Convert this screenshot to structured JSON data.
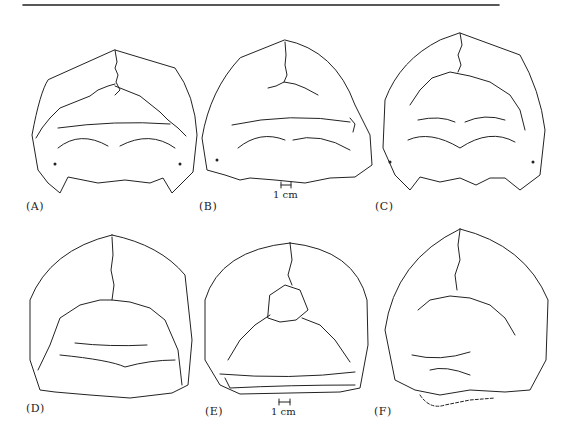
{
  "figure": {
    "panels": [
      {
        "id": "A",
        "label": "(A)"
      },
      {
        "id": "B",
        "label": "(B)",
        "scale_bar": "1 cm"
      },
      {
        "id": "C",
        "label": "(C)"
      },
      {
        "id": "D",
        "label": "(D)"
      },
      {
        "id": "E",
        "label": "(E)",
        "scale_bar": "1 cm"
      },
      {
        "id": "F",
        "label": "(F)"
      }
    ],
    "stroke_color": "#222222",
    "background": "#ffffff"
  }
}
